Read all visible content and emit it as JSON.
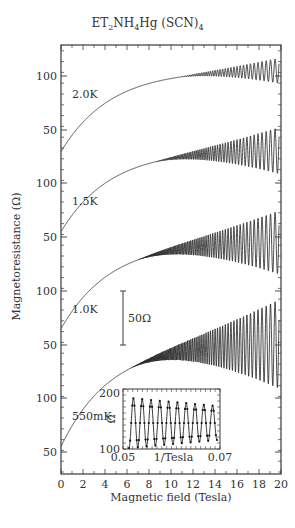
{
  "chart_data": {
    "type": "line",
    "title": "ET2NH4Hg (SCN)4",
    "title_parts": {
      "a": "ET",
      "s1": "2",
      "b": "NH",
      "s2": "4",
      "c": "Hg (SCN)",
      "s3": "4"
    },
    "xlabel": "Magnetic field (Tesla)",
    "ylabel": "Magnetoresistance (Ω)",
    "xlim": [
      0,
      20
    ],
    "xticks": [
      0,
      2,
      4,
      6,
      8,
      10,
      12,
      14,
      16,
      18,
      20
    ],
    "left_tick_labels": [
      {
        "label": "100",
        "y": 76
      },
      {
        "label": "50",
        "y": 130
      },
      {
        "label": "100",
        "y": 183
      },
      {
        "label": "50",
        "y": 237
      },
      {
        "label": "100",
        "y": 291
      },
      {
        "label": "50",
        "y": 345
      },
      {
        "label": "100",
        "y": 398
      },
      {
        "label": "50",
        "y": 452
      }
    ],
    "scale_bar": {
      "label": "50Ω",
      "ohms": 50
    },
    "series": [
      {
        "name": "2.0K",
        "label_pos": [
          72,
          98
        ],
        "start_ohm": 30,
        "end_ohm": 105,
        "y_ref_100": 76,
        "osc_onset_T": 10,
        "osc_amp_end": 12,
        "ref": 100
      },
      {
        "name": "1.5K",
        "label_pos": [
          72,
          205
        ],
        "start_ohm": 55,
        "end_ohm": 130,
        "y_ref_100": 183,
        "osc_onset_T": 8,
        "osc_amp_end": 22,
        "ref": 100
      },
      {
        "name": "1.0K",
        "label_pos": [
          72,
          313
        ],
        "start_ohm": 65,
        "end_ohm": 145,
        "y_ref_100": 291,
        "osc_onset_T": 6.5,
        "osc_amp_end": 30,
        "ref": 100
      },
      {
        "name": "550mK",
        "label_pos": [
          72,
          420
        ],
        "start_ohm": 55,
        "end_ohm": 150,
        "y_ref_100": 398,
        "osc_onset_T": 6,
        "osc_amp_end": 42,
        "ref": 100
      }
    ],
    "inset": {
      "xlabel": "1/Tesla",
      "ylabel": "Ω",
      "xticks": [
        "0.05",
        "0.07"
      ],
      "yticks": [
        "100",
        "200"
      ],
      "xlim": [
        0.05,
        0.07
      ],
      "ylim": [
        100,
        200
      ],
      "n_peaks": 10
    }
  }
}
